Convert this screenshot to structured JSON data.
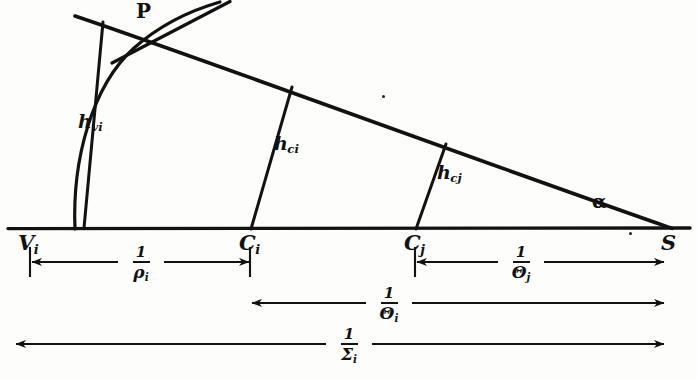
{
  "figure": {
    "kind": "hand-drawn geometric ray diagram",
    "background_color": "#fdfdfb",
    "ink_color": "#121212"
  },
  "baseline": {
    "label": "horizontal axis",
    "y": 228,
    "x_start": 8,
    "x_end": 690
  },
  "points": [
    {
      "name": "vertex-v-i",
      "label": "V",
      "sub": "i",
      "x": 30,
      "y": 228,
      "label_x": 18,
      "label_y": 232
    },
    {
      "name": "point-c-i",
      "label": "C",
      "sub": "i",
      "x": 250,
      "y": 228,
      "label_x": 239,
      "label_y": 232
    },
    {
      "name": "point-c-j",
      "label": "C",
      "sub": "j",
      "x": 415,
      "y": 228,
      "label_x": 404,
      "label_y": 232
    },
    {
      "name": "point-s",
      "label": "S",
      "sub": "",
      "x": 665,
      "y": 228,
      "label_x": 661,
      "label_y": 232
    },
    {
      "name": "point-p",
      "label": "P",
      "sub": "",
      "x": 145,
      "y": 14,
      "label_x": 136,
      "label_y": 2
    }
  ],
  "segments": [
    {
      "name": "h-vi-segment",
      "label": "h",
      "sub": "vi",
      "x1": 83,
      "y1": 228,
      "x2": 103,
      "y2": 22,
      "label_x": 78,
      "label_y": 112
    },
    {
      "name": "h-ci-segment",
      "label": "h",
      "sub": "ci",
      "x1": 250,
      "y1": 228,
      "x2": 291,
      "y2": 88,
      "label_x": 274,
      "label_y": 134
    },
    {
      "name": "h-cj-segment",
      "label": "h",
      "sub": "cj",
      "x1": 415,
      "y1": 228,
      "x2": 445,
      "y2": 145,
      "label_x": 437,
      "label_y": 163
    }
  ],
  "angle": {
    "name": "angle-alpha",
    "symbol": "α",
    "label_x": 592,
    "label_y": 192
  },
  "slant_line": {
    "name": "slant-ray",
    "x1": 75,
    "y1": 16,
    "x2": 672,
    "y2": 228
  },
  "tangent_line": {
    "name": "tangent-at-p",
    "x1": 112,
    "y1": 63,
    "x2": 228,
    "y2": 2
  },
  "arc": {
    "name": "curved-arc",
    "from_x": 75,
    "from_y": 228,
    "to_x": 218,
    "to_y": 60
  },
  "dimensions": [
    {
      "name": "dimension-rho-i",
      "x_start": 30,
      "x_end": 250,
      "y": 262,
      "numerator": "1",
      "denominator": "ρ",
      "den_sub": "i",
      "label_center_x": 140
    },
    {
      "name": "dimension-theta-j",
      "x_start": 415,
      "x_end": 665,
      "y": 262,
      "numerator": "1",
      "denominator": "Θ",
      "den_sub": "j",
      "label_center_x": 520
    },
    {
      "name": "dimension-theta-i",
      "x_start": 250,
      "x_end": 665,
      "y": 303,
      "numerator": "1",
      "denominator": "Θ",
      "den_sub": "i",
      "label_center_x": 388
    },
    {
      "name": "dimension-sigma-i",
      "x_start": 14,
      "x_end": 665,
      "y": 344,
      "numerator": "1",
      "denominator": "Σ",
      "den_sub": "i",
      "label_center_x": 348
    }
  ],
  "stray_marks": [
    {
      "name": "stray-dot-upper",
      "x": 382,
      "y": 95
    },
    {
      "name": "stray-dot-baseline",
      "x": 629,
      "y": 232
    }
  ]
}
